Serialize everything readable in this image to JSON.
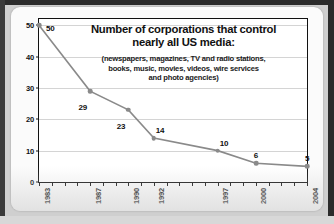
{
  "chart_data": {
    "type": "line",
    "title": "Number of corporations that control nearly all US media:",
    "title_line1": "Number of corporations that control",
    "title_line2": "nearly all US media:",
    "subtitle_line1": "(newspapers, magazines, TV and radio stations,",
    "subtitle_line2": "books, music, movies, videos, wire services",
    "subtitle_line3": "and photo agencies)",
    "xlabel": "",
    "ylabel": "",
    "x": [
      1983,
      1987,
      1990,
      1992,
      1997,
      2000,
      2004
    ],
    "values": [
      50,
      29,
      23,
      14,
      10,
      6,
      5
    ],
    "point_labels": [
      "50",
      "29",
      "23",
      "14",
      "10",
      "6",
      "5"
    ],
    "xlim": [
      1983,
      2004
    ],
    "ylim": [
      0,
      52
    ],
    "ytick_labels": [
      "0",
      "10",
      "20",
      "30",
      "40",
      "50"
    ],
    "ytick_values": [
      0,
      10,
      20,
      30,
      40,
      50
    ],
    "xtick_labels": [
      "1983",
      "1987",
      "1990",
      "1992",
      "1997",
      "2000",
      "2004"
    ],
    "xtick_values": [
      1983,
      1987,
      1990,
      1992,
      1997,
      2000,
      2004
    ],
    "minor_xticks": [
      1983,
      1984,
      1985,
      1986,
      1987,
      1988,
      1989,
      1990,
      1991,
      1992,
      1993,
      1994,
      1995,
      1996,
      1997,
      1998,
      1999,
      2000,
      2001,
      2002,
      2003,
      2004
    ],
    "grid": true,
    "legend": false,
    "series_color": "#8a8a8a",
    "grid_color": "#d4d4d4",
    "axis_color": "#111111"
  }
}
